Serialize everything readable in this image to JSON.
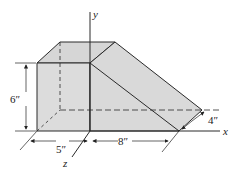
{
  "figure": {
    "axes": {
      "x": "x",
      "y": "y",
      "z": "z"
    },
    "dimensions": {
      "height": "6″",
      "width_front": "5″",
      "length_slope": "8″",
      "depth": "4″"
    },
    "colors": {
      "fill": "#d9d9d9",
      "edge": "#2a2a2a",
      "background": "#ffffff"
    }
  }
}
